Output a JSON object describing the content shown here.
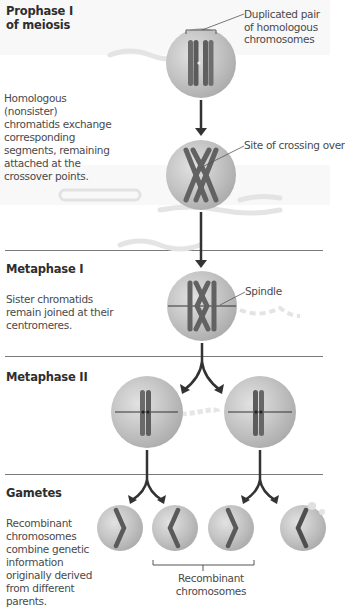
{
  "figure": {
    "colors": {
      "cell_fill": "#c2c2c2",
      "cell_highlight": "#e6e6e6",
      "chromosome": "#6a6a6a",
      "chromosome_dark": "#4a4a4a",
      "arrow": "#3a3a3a",
      "divider": "#7a7a7a",
      "text": "#4a4a4a"
    },
    "sections": [
      {
        "id": "prophase-1",
        "heading": "Prophase I",
        "heading_line2": "of meiosis",
        "description_1": "Homologous (nonsister) chromatids exchange corresponding segments, remaining attached at the crossover points.",
        "callouts": [
          {
            "text": "Duplicated pair of homologous chromosomes"
          },
          {
            "text": "Site of crossing over"
          }
        ]
      },
      {
        "id": "metaphase-1",
        "heading": "Metaphase I",
        "description": "Sister chromatids remain joined at their centromeres.",
        "callouts": [
          {
            "text": "Spindle"
          }
        ]
      },
      {
        "id": "metaphase-2",
        "heading": "Metaphase II"
      },
      {
        "id": "gametes",
        "heading": "Gametes",
        "description": "Recombinant chromosomes combine genetic information originally derived from different parents.",
        "callouts": [
          {
            "text": "Recombinant chromosomes"
          }
        ]
      }
    ]
  }
}
